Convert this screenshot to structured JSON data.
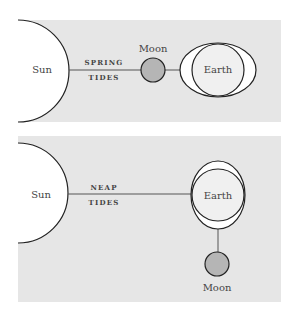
{
  "colors": {
    "panel_bg": "#e6e6e6",
    "sun_fill": "#ffffff",
    "earth_fill": "#f0f0f0",
    "bulge_fill": "#ffffff",
    "moon_fill": "#b5b5b5",
    "stroke": "#222222",
    "text": "#444444"
  },
  "spring": {
    "sun_label": "Sun",
    "caption_line1": "SPRING",
    "caption_line2": "TIDES",
    "moon_label": "Moon",
    "earth_label": "Earth"
  },
  "neap": {
    "sun_label": "Sun",
    "caption_line1": "NEAP",
    "caption_line2": "TIDES",
    "earth_label": "Earth",
    "moon_label": "Moon"
  }
}
